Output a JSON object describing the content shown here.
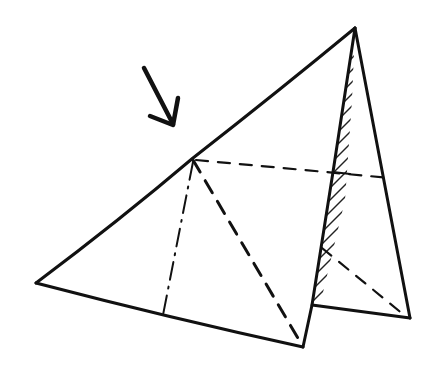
{
  "diagram": {
    "description": "Hand-drawn sketch of a folded triangular sheet with a hatched shaded face and an arrow pointing to the fold vertex",
    "stroke_color": "#111111",
    "background_color": "#ffffff",
    "vertices": {
      "left": [
        36,
        283
      ],
      "fold_top": [
        193,
        158
      ],
      "apex": [
        355,
        28
      ],
      "bottom": [
        303,
        347
      ],
      "right_bottom": [
        410,
        318
      ],
      "inner_bottom": [
        312,
        305
      ],
      "inner_mid": [
        333,
        172
      ],
      "dashdot_foot": [
        163,
        315
      ]
    },
    "elements": [
      {
        "type": "arrow",
        "label": "arrow pointing to fold vertex"
      },
      {
        "type": "solid-edge",
        "label": "left-to-apex edge"
      },
      {
        "type": "solid-edge",
        "label": "left-to-bottom edge"
      },
      {
        "type": "dashed-line",
        "label": "fold diagonal"
      },
      {
        "type": "dash-dot-line",
        "label": "altitude line"
      },
      {
        "type": "dashed-line",
        "label": "horizontal hidden edge"
      },
      {
        "type": "hatched-face",
        "label": "shaded folded flap"
      },
      {
        "type": "solid-edge",
        "label": "right triangle outline"
      }
    ]
  }
}
